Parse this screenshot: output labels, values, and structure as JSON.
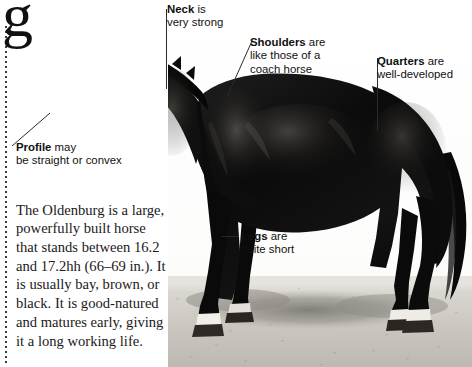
{
  "page": {
    "background_color": "#ffffff",
    "cut_off_heading_glyph": "g",
    "rule_color": "#3a3a3a"
  },
  "photo": {
    "subject": "oldenburg-horse-side-profile",
    "description": "Black and white photograph of a black Oldenburg horse standing in profile facing left on light sandy ground with its shadow",
    "horse_color": "#0d0d0d",
    "ground_color": "#cfccc6",
    "sky_color": "#ffffff"
  },
  "callouts": [
    {
      "id": "neck",
      "keyword": "Neck",
      "text": " is",
      "line2": "very strong"
    },
    {
      "id": "shoulders",
      "keyword": "Shoulders",
      "text": " are",
      "line2": "like those of a",
      "line3": "coach horse"
    },
    {
      "id": "quarters",
      "keyword": "Quarters",
      "text": " are",
      "line2": "well-developed"
    },
    {
      "id": "profile",
      "keyword": "Profile",
      "text": " may",
      "line2": "be straight or convex"
    },
    {
      "id": "legs",
      "keyword": "Legs",
      "text": " are",
      "line2": "quite short"
    }
  ],
  "body": {
    "paragraph": "The Oldenburg is a large, powerfully built horse that stands between 16.2 and 17.2hh (66–69 in.). It is usually bay, brown, or black. It is good-natured and matures early, giving it a long working life."
  }
}
